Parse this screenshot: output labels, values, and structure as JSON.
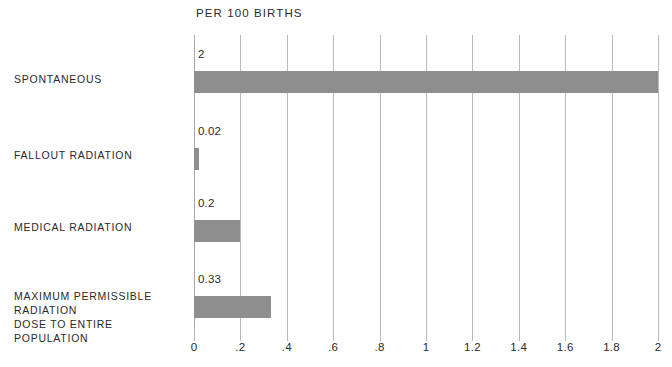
{
  "chart_data": {
    "type": "bar",
    "orientation": "horizontal",
    "title": "PER 100 BIRTHS",
    "xlabel": "",
    "ylabel": "",
    "xlim": [
      0,
      2
    ],
    "grid": true,
    "legend": "none",
    "bar_color": "#8e8e8e",
    "gridline_color": "#b9b9b9",
    "categories": [
      "SPONTANEOUS",
      "FALLOUT RADIATION",
      "MEDICAL RADIATION",
      "MAXIMUM PERMISSIBLE RADIATION\nDOSE TO ENTIRE POPULATION"
    ],
    "values": [
      2,
      0.02,
      0.2,
      0.33
    ],
    "value_labels": [
      "2",
      "0.02",
      "0.2",
      "0.33"
    ],
    "xticks": [
      0,
      0.2,
      0.4,
      0.6,
      0.8,
      1,
      1.2,
      1.4,
      1.6,
      1.8,
      2
    ],
    "xtick_labels": [
      "0",
      ".2",
      ".4",
      ".6",
      ".8",
      "1",
      "1.2",
      "1.4",
      "1.6",
      "1.8",
      "2"
    ]
  },
  "bars": [
    {
      "label": "SPONTANEOUS",
      "value_label": "2",
      "top": 71,
      "label_top": 72,
      "value_top": 48,
      "width_pct": 100
    },
    {
      "label": "FALLOUT RADIATION",
      "value_label": "0.02",
      "top": 148,
      "label_top": 148,
      "value_top": 125,
      "width_pct": 1
    },
    {
      "label": "MEDICAL RADIATION",
      "value_label": "0.2",
      "top": 220,
      "label_top": 220,
      "value_top": 197,
      "width_pct": 10
    },
    {
      "label": "MAXIMUM PERMISSIBLE RADIATION\nDOSE TO ENTIRE POPULATION",
      "value_label": "0.33",
      "top": 296,
      "label_top": 289,
      "value_top": 273,
      "width_pct": 16.5
    }
  ],
  "xticks": [
    {
      "label": "0",
      "pos_pct": 0
    },
    {
      "label": ".2",
      "pos_pct": 10
    },
    {
      "label": ".4",
      "pos_pct": 20
    },
    {
      "label": ".6",
      "pos_pct": 30
    },
    {
      "label": ".8",
      "pos_pct": 40
    },
    {
      "label": "1",
      "pos_pct": 50
    },
    {
      "label": "1.2",
      "pos_pct": 60
    },
    {
      "label": "1.4",
      "pos_pct": 70
    },
    {
      "label": "1.6",
      "pos_pct": 80
    },
    {
      "label": "1.8",
      "pos_pct": 90
    },
    {
      "label": "2",
      "pos_pct": 100
    }
  ]
}
